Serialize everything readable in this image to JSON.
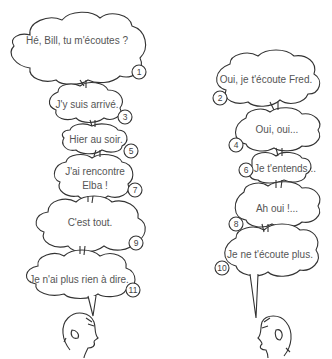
{
  "speakers": {
    "left": {
      "name": "Fred",
      "icon": "head-profile-facing-right"
    },
    "right": {
      "name": "Bill",
      "icon": "head-profile-facing-left"
    }
  },
  "bubbles": [
    {
      "n": "1",
      "side": "left",
      "lines": [
        "Hé, Bill, tu m'écoutes ?"
      ]
    },
    {
      "n": "2",
      "side": "right",
      "lines": [
        "Oui, je t'écoute Fred."
      ]
    },
    {
      "n": "3",
      "side": "left",
      "lines": [
        "J'y suis arrivé."
      ]
    },
    {
      "n": "4",
      "side": "right",
      "lines": [
        "Oui, oui..."
      ]
    },
    {
      "n": "5",
      "side": "left",
      "lines": [
        "Hier au soir."
      ]
    },
    {
      "n": "6",
      "side": "right",
      "lines": [
        "Je t'entends..."
      ]
    },
    {
      "n": "7",
      "side": "left",
      "lines": [
        "J'ai rencontre",
        "Elba !"
      ]
    },
    {
      "n": "8",
      "side": "right",
      "lines": [
        "Ah oui !..."
      ]
    },
    {
      "n": "9",
      "side": "left",
      "lines": [
        "C'est tout."
      ]
    },
    {
      "n": "10",
      "side": "right",
      "lines": [
        "Je ne t'écoute plus."
      ]
    },
    {
      "n": "11",
      "side": "left",
      "lines": [
        "Je n'ai plus rien à dire."
      ]
    }
  ],
  "colors": {
    "stroke": "#333333",
    "text": "#555555",
    "background": "#ffffff"
  }
}
